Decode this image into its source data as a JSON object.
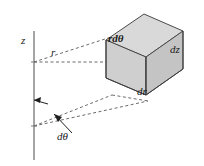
{
  "figure": {
    "caption": "",
    "type": "technical-diagram",
    "background_color": "#ffffff",
    "line_color": "#3a3a3a",
    "labels": {
      "z_axis": "z",
      "radius": "r",
      "arc_length": "rdθ",
      "height": "dz",
      "radial_thickness": "dr",
      "angle": "dθ"
    },
    "box": {
      "top_face_fill": "#d8d8d8",
      "front_face_fill": "#c9c9c9",
      "side_face_fill": "#bdbdbd",
      "edge_color": "#4a4a4a"
    },
    "axis": {
      "stroke": "#8a8a8a",
      "x": 34,
      "y_top": 32,
      "y_bottom": 160
    },
    "rays": {
      "stroke": "#555555",
      "dash": "3 3",
      "origin_upper": [
        34,
        62
      ],
      "origin_lower": [
        34,
        126
      ]
    }
  }
}
